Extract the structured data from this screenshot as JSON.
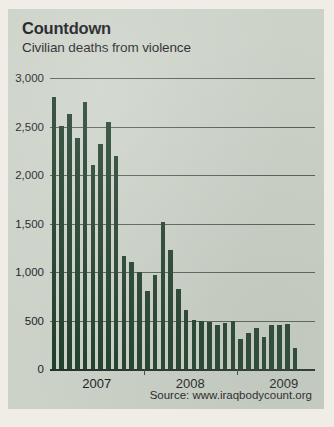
{
  "panel": {
    "background_color": "#ccd2c8",
    "page_color": "#efede6"
  },
  "header": {
    "title": "Countdown",
    "subtitle": "Civilian deaths from violence"
  },
  "footer": {
    "source": "Source: www.iraqbodycount.org"
  },
  "chart_data": {
    "type": "bar",
    "title": "Countdown",
    "subtitle": "Civilian deaths from violence",
    "xlabel": "",
    "ylabel": "",
    "ylim": [
      0,
      3000
    ],
    "grid": true,
    "legend": false,
    "bar_color": "#203f2a",
    "ytick_labels": [
      "0",
      "500",
      "1,000",
      "1,500",
      "2,000",
      "2,500",
      "3,000"
    ],
    "ytick_values": [
      0,
      500,
      1000,
      1500,
      2000,
      2500,
      3000
    ],
    "xtick_labels": [
      "2007",
      "2008",
      "2009"
    ],
    "xtick_positions": [
      6,
      18,
      30
    ],
    "xtick_marks": [
      12,
      24
    ],
    "categories": [
      "2007-01",
      "2007-02",
      "2007-03",
      "2007-04",
      "2007-05",
      "2007-06",
      "2007-07",
      "2007-08",
      "2007-09",
      "2007-10",
      "2007-11",
      "2007-12",
      "2008-01",
      "2008-02",
      "2008-03",
      "2008-04",
      "2008-05",
      "2008-06",
      "2008-07",
      "2008-08",
      "2008-09",
      "2008-10",
      "2008-11",
      "2008-12",
      "2009-01",
      "2009-02",
      "2009-03",
      "2009-04",
      "2009-05",
      "2009-06",
      "2009-07",
      "2009-08",
      "2009-09",
      "2009-10"
    ],
    "values": [
      2800,
      2510,
      2630,
      2380,
      2750,
      2100,
      2320,
      2550,
      2200,
      1170,
      1100,
      1000,
      800,
      970,
      1520,
      1230,
      820,
      610,
      510,
      500,
      480,
      450,
      470,
      490,
      310,
      370,
      420,
      330,
      450,
      450,
      460,
      220,
      0,
      0
    ]
  }
}
